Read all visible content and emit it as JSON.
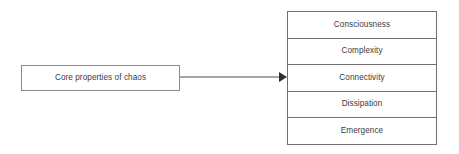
{
  "diagram": {
    "type": "flow-diagram",
    "source": {
      "label": "Core properties of chaos"
    },
    "connector": {
      "kind": "arrow",
      "direction": "left-to-right",
      "arrowhead": "solid-triangle",
      "color": "#4d4d4d",
      "target_row": "Connectivity"
    },
    "stack": {
      "items": [
        {
          "label": "Consciousness"
        },
        {
          "label": "Complexity"
        },
        {
          "label": "Connectivity"
        },
        {
          "label": "Dissipation"
        },
        {
          "label": "Emergence"
        }
      ]
    },
    "colors": {
      "background": "#ffffff",
      "box_border": "#8a8a8a",
      "stack_border": "#6f6f6f",
      "text": "#3b3b3b",
      "connector": "#4d4d4d"
    }
  }
}
